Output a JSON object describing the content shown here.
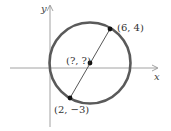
{
  "diagram": {
    "axes": {
      "x_label": "x",
      "y_label": "y"
    },
    "circle": {
      "stroke_color": "#5a5a5a"
    },
    "points": [
      {
        "id": "p1",
        "label": "(6, 4)"
      },
      {
        "id": "center",
        "label": "(?, ?)"
      },
      {
        "id": "p2",
        "label": "(2, −3)"
      }
    ],
    "colors": {
      "axis": "#888888",
      "circle": "#5a5a5a",
      "diameter": "#444444",
      "points": "#111111"
    }
  }
}
